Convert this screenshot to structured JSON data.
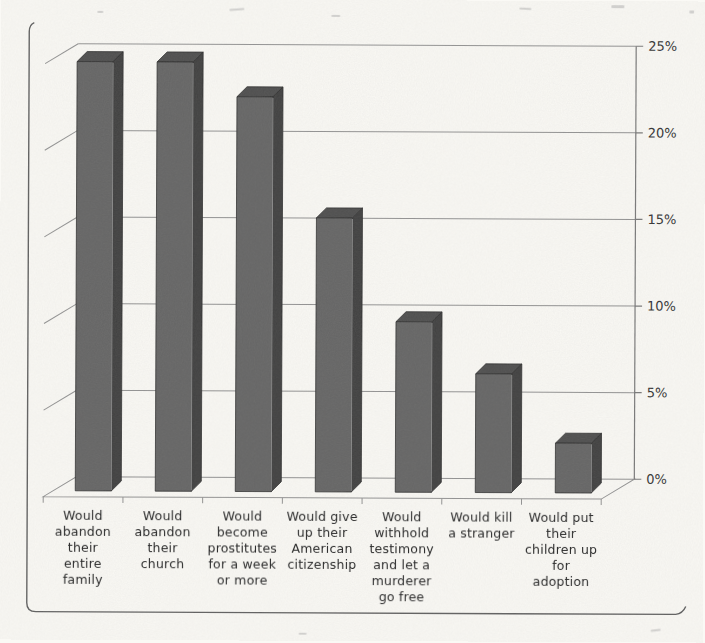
{
  "figure": {
    "background_color": "#faf9f5",
    "border_color": "#5f5f5f"
  },
  "chart_data": {
    "type": "bar",
    "is_3d": true,
    "title": "",
    "xlabel": "",
    "ylabel": "",
    "categories": [
      "Would abandon their entire family",
      "Would abandon their church",
      "Would become prostitutes for a week or more",
      "Would give up their American citizenship",
      "Would withhold testimony and let a murderer go free",
      "Would kill a stranger",
      "Would put their children up for adoption"
    ],
    "category_label_lines": [
      [
        "Would",
        "abandon",
        "their",
        "entire",
        "family"
      ],
      [
        "Would",
        "abandon",
        "their",
        "church"
      ],
      [
        "Would",
        "become",
        "prostitutes",
        "for a week",
        "or more"
      ],
      [
        "Would give",
        "up their",
        "American",
        "citizenship"
      ],
      [
        "Would",
        "withhold",
        "testimony",
        "and let a",
        "murderer",
        "go free"
      ],
      [
        "Would kill",
        "a stranger"
      ],
      [
        "Would put",
        "their",
        "children up",
        "for",
        "adoption"
      ]
    ],
    "values": [
      25,
      25,
      23,
      16,
      10,
      7,
      3
    ],
    "ylim": [
      0,
      25
    ],
    "y_ticks": [
      0,
      5,
      10,
      15,
      20,
      25
    ],
    "y_tick_labels": [
      "0%",
      "5%",
      "10%",
      "15%",
      "20%",
      "25%"
    ],
    "y_axis_side": "right",
    "grid": true,
    "legend": false,
    "colors": {
      "bar_front": "#646464",
      "bar_side": "#3f3f3f",
      "bar_top": "#4d4d4d",
      "bar_edge": "#2e2e2e",
      "bar_highlight": "#9c9c9c",
      "gridline": "#929292",
      "axis": "#787878",
      "tick_text": "#333333"
    }
  }
}
